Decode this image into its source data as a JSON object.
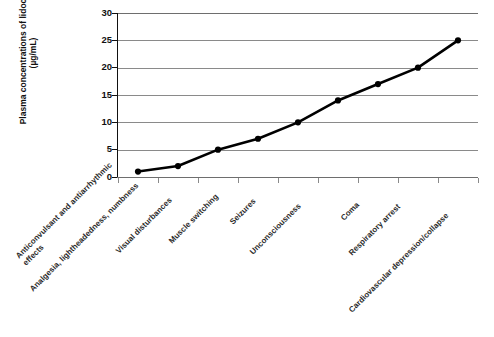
{
  "figure": {
    "artifact_top_text": "cut-off text line from facing page",
    "artifact_bottom_text": "partial figure caption, illegible"
  },
  "chart_data": {
    "type": "line",
    "title": "",
    "xlabel": "",
    "ylabel": "Plasma concentrations of lidocaine (µg/mL)",
    "ylabel_line1": "Plasma concentrations of lidocaine",
    "ylabel_line2": "(µg/mL)",
    "ylim": [
      0,
      30
    ],
    "ytick_step": 5,
    "yticks": [
      0,
      5,
      10,
      15,
      20,
      25,
      30
    ],
    "ytick_labels": [
      "0",
      "5",
      "10",
      "15",
      "20",
      "25",
      "30"
    ],
    "grid": true,
    "grid_axis": "y",
    "legend": false,
    "legend_position": "none",
    "line_color": "#000000",
    "marker": "circle",
    "marker_color": "#000000",
    "categories": [
      "Anticonvulsant and antiarrhythmic\neffects",
      "Analgesia, lightheadedness, numbness",
      "Visual disturbances",
      "Muscle switching",
      "Seizures",
      "Unconsciousness",
      "Coma",
      "Respiratory arrest",
      "Cardiovascular depression/collapse"
    ],
    "values": [
      1,
      2,
      5,
      7,
      10,
      14,
      17,
      20,
      25
    ],
    "points": [
      {
        "category": "Anticonvulsant and antiarrhythmic effects",
        "value": 1
      },
      {
        "category": "Analgesia, lightheadedness, numbness",
        "value": 2
      },
      {
        "category": "Visual disturbances",
        "value": 5
      },
      {
        "category": "Muscle switching",
        "value": 7
      },
      {
        "category": "Seizures",
        "value": 10
      },
      {
        "category": "Unconsciousness",
        "value": 14
      },
      {
        "category": "Coma",
        "value": 17
      },
      {
        "category": "Respiratory arrest",
        "value": 20
      },
      {
        "category": "Cardiovascular depression/collapse",
        "value": 25
      }
    ]
  }
}
